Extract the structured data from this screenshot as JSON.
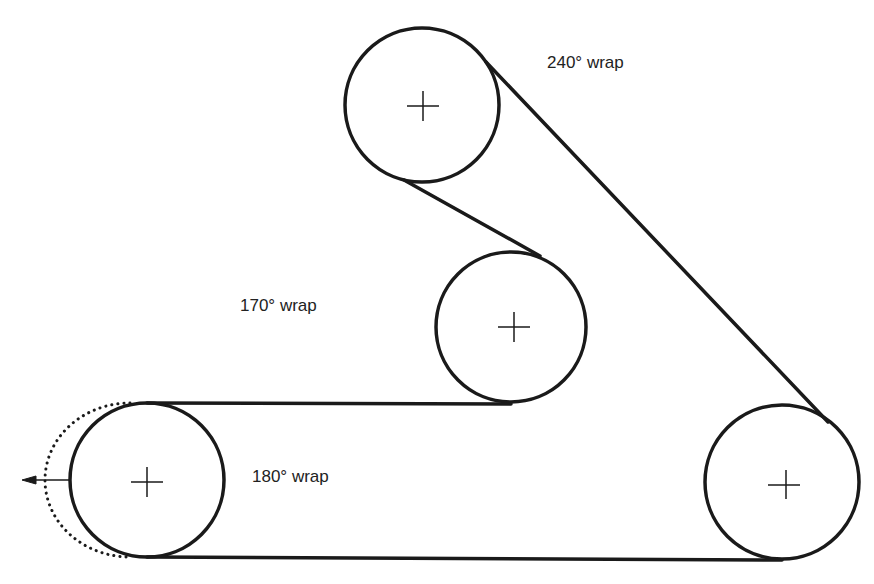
{
  "diagram": {
    "type": "belt-pulley-wrap-angles",
    "stroke_color": "#1a1a1a",
    "pulleys": [
      {
        "id": "top",
        "cx": 422,
        "cy": 105,
        "r": 77
      },
      {
        "id": "middle",
        "cx": 511,
        "cy": 327,
        "r": 75
      },
      {
        "id": "bottom-left",
        "cx": 147,
        "cy": 480,
        "r": 77
      },
      {
        "id": "bottom-right",
        "cx": 782,
        "cy": 482,
        "r": 77
      }
    ],
    "labels": {
      "top_wrap": "240° wrap",
      "middle_wrap": "170° wrap",
      "bottom_left_wrap": "180° wrap"
    }
  }
}
